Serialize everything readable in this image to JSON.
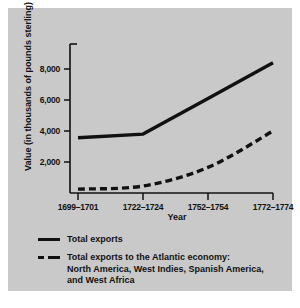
{
  "figure": {
    "panel_background": "#c9c9c9",
    "page_background": "#ffffff",
    "ink_color": "#111111"
  },
  "chart_data": {
    "type": "line",
    "title": "",
    "xlabel": "Year",
    "ylabel": "Value (in thousands of pounds sterling)",
    "categories": [
      "1699–1701",
      "1722–1724",
      "1752–1754",
      "1772–1774"
    ],
    "ylim": [
      0,
      9000
    ],
    "yticks": [
      2000,
      4000,
      6000,
      8000
    ],
    "ytick_labels": [
      "2,000",
      "4,000",
      "6,000",
      "8,000"
    ],
    "grid": false,
    "legend_position": "below-plot",
    "series": [
      {
        "name": "Total exports",
        "style": "solid",
        "color": "#111111",
        "values": [
          3570,
          3800,
          6100,
          8400
        ]
      },
      {
        "name": "Total exports to the Atlantic economy: North America, West Indies, Spanish America, and West Africa",
        "style": "dashed",
        "color": "#111111",
        "values": [
          250,
          450,
          1650,
          4000
        ]
      }
    ]
  },
  "legend": {
    "items": [
      {
        "label": "Total exports",
        "label_line2": "",
        "label_line3": "",
        "style": "solid"
      },
      {
        "label": "Total exports to the Atlantic economy:",
        "label_line2": "North America, West Indies, Spanish America,",
        "label_line3": "and West Africa",
        "style": "dashed"
      }
    ]
  }
}
